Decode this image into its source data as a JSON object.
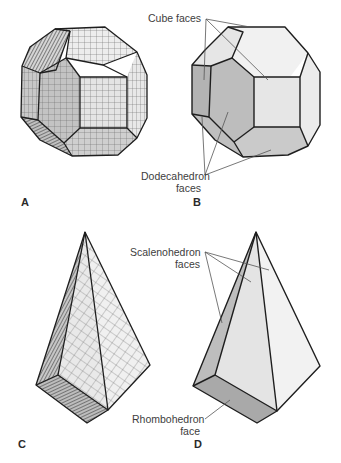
{
  "figure": {
    "panels": [
      {
        "id": "A",
        "letter": "A",
        "description": "Cube-dodecahedron combination crystal built from stacked cubic unit cells"
      },
      {
        "id": "B",
        "letter": "B",
        "description": "Idealized cube-dodecahedron combination form"
      },
      {
        "id": "C",
        "letter": "C",
        "description": "Scalenohedron-rhombohedron crystal built from stacked unit cells"
      },
      {
        "id": "D",
        "letter": "D",
        "description": "Idealized scalenohedron with rhombohedron termination"
      }
    ],
    "labels": {
      "cube_faces": "Cube faces",
      "dodecahedron_line1": "Dodecahedron",
      "dodecahedron_line2": "faces",
      "scalenohedron_line1": "Scalenohedron",
      "scalenohedron_line2": "faces",
      "rhombohedron_line1": "Rhombohedron",
      "rhombohedron_line2": "face"
    },
    "colors": {
      "outline": "#1e1e1e",
      "face_light": "#ececec",
      "face_mid": "#d9d9d9",
      "face_dark": "#b5b5b5",
      "face_darker": "#a9a9a9",
      "leader_line": "#555555",
      "grid_line": "#6a6a6a"
    }
  }
}
